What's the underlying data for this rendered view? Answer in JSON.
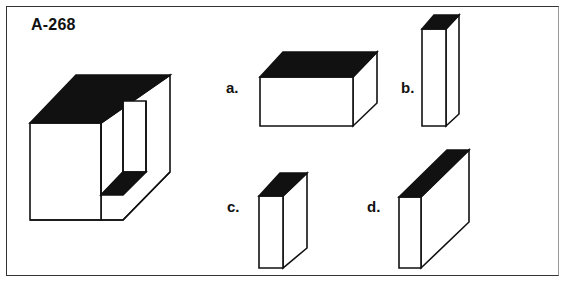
{
  "puzzle": {
    "id": "A-268",
    "options": [
      {
        "label": "a."
      },
      {
        "label": "b."
      },
      {
        "label": "c."
      },
      {
        "label": "d."
      }
    ]
  },
  "colors": {
    "ink": "#111111",
    "paper": "#ffffff",
    "frame": "#333333"
  }
}
